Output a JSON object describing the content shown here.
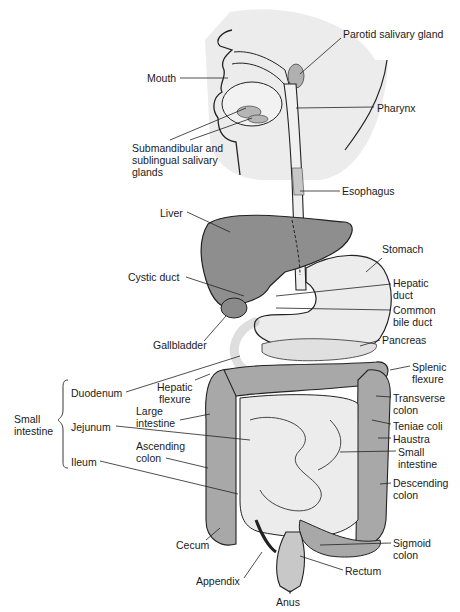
{
  "diagram": {
    "type": "anatomical-illustration",
    "colors": {
      "background": "#ffffff",
      "head_shade": "#ececec",
      "liver": "#8e8e8e",
      "organ_fill": "#eaeaea",
      "colon": "#a8a8a8",
      "outline": "#222222"
    },
    "labels": [
      {
        "id": "parotid",
        "text": "Parotid salivary gland",
        "x": 343,
        "y": 34
      },
      {
        "id": "mouth",
        "text": "Mouth",
        "x": 147,
        "y": 73
      },
      {
        "id": "pharynx",
        "text": "Pharynx",
        "x": 377,
        "y": 103
      },
      {
        "id": "submandibular",
        "text": "Submandibular and\nsublingual salivary\nglands",
        "x": 132,
        "y": 143
      },
      {
        "id": "esophagus",
        "text": "Esophagus",
        "x": 342,
        "y": 186
      },
      {
        "id": "liver",
        "text": "Liver",
        "x": 160,
        "y": 208
      },
      {
        "id": "stomach",
        "text": "Stomach",
        "x": 382,
        "y": 244
      },
      {
        "id": "cystic_duct",
        "text": "Cystic duct",
        "x": 128,
        "y": 272
      },
      {
        "id": "hepatic_duct",
        "text": "Hepatic\nduct",
        "x": 393,
        "y": 278
      },
      {
        "id": "common_bile_duct",
        "text": "Common\nbile duct",
        "x": 393,
        "y": 305
      },
      {
        "id": "gallbladder",
        "text": "Gallbladder",
        "x": 153,
        "y": 340
      },
      {
        "id": "pancreas",
        "text": "Pancreas",
        "x": 382,
        "y": 335
      },
      {
        "id": "splenic_flexure",
        "text": "Splenic\nflexure",
        "x": 412,
        "y": 362
      },
      {
        "id": "hepatic_flexure",
        "text": "Hepatic\nflexure",
        "x": 157,
        "y": 382
      },
      {
        "id": "duodenum",
        "text": "Duodenum",
        "x": 71,
        "y": 388
      },
      {
        "id": "transverse_colon",
        "text": "Transverse\ncolon",
        "x": 393,
        "y": 393
      },
      {
        "id": "small_intestine_group",
        "text": "Small\nintestine",
        "x": 14,
        "y": 414
      },
      {
        "id": "large_intestine",
        "text": "Large\nintestine",
        "x": 136,
        "y": 406
      },
      {
        "id": "jejunum",
        "text": "Jejunum",
        "x": 71,
        "y": 422
      },
      {
        "id": "teniae_coli",
        "text": "Teniae coli",
        "x": 393,
        "y": 421
      },
      {
        "id": "haustra",
        "text": "Haustra",
        "x": 393,
        "y": 434
      },
      {
        "id": "small_intestine",
        "text": "Small\nintestine",
        "x": 398,
        "y": 447
      },
      {
        "id": "ascending_colon",
        "text": "Ascending\ncolon",
        "x": 136,
        "y": 441
      },
      {
        "id": "ileum",
        "text": "Ileum",
        "x": 71,
        "y": 457
      },
      {
        "id": "descending_colon",
        "text": "Descending\ncolon",
        "x": 393,
        "y": 478
      },
      {
        "id": "cecum",
        "text": "Cecum",
        "x": 176,
        "y": 540
      },
      {
        "id": "sigmoid_colon",
        "text": "Sigmoid\ncolon",
        "x": 393,
        "y": 538
      },
      {
        "id": "rectum",
        "text": "Rectum",
        "x": 345,
        "y": 566
      },
      {
        "id": "appendix",
        "text": "Appendix",
        "x": 196,
        "y": 576
      },
      {
        "id": "anus",
        "text": "Anus",
        "x": 276,
        "y": 597
      }
    ],
    "group": {
      "label": "Small intestine",
      "members": [
        "Duodenum",
        "Jejunum",
        "Ileum"
      ]
    }
  }
}
